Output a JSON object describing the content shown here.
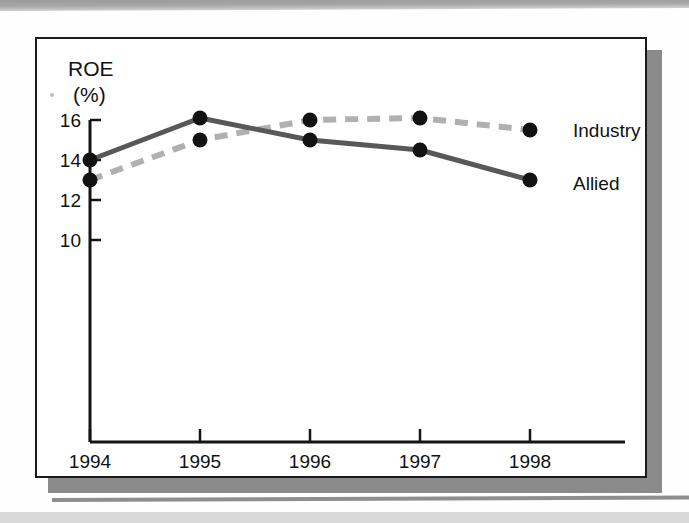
{
  "chart_data": {
    "type": "line",
    "title": "",
    "subtitle": "",
    "xlabel": "",
    "ylabel": "ROE",
    "ylabel_unit": "(%)",
    "categories": [
      "1994",
      "1995",
      "1996",
      "1997",
      "1998"
    ],
    "x": [
      1994,
      1995,
      1996,
      1997,
      1998
    ],
    "series": [
      {
        "name": "Industry",
        "values": [
          13,
          15,
          16,
          16.1,
          15.5
        ],
        "style": "dashed",
        "color": "#b0b0b0",
        "marker": "circle"
      },
      {
        "name": "Allied",
        "values": [
          14,
          16.1,
          15,
          14.5,
          13
        ],
        "style": "solid",
        "color": "#585858",
        "marker": "circle"
      }
    ],
    "yticks": [
      16,
      14,
      12,
      10
    ],
    "ytick_labels": [
      "16",
      "14",
      "12",
      "10"
    ],
    "ylim": [
      8.4,
      16.6
    ],
    "xtick_labels": [
      "1994",
      "1995",
      "1996",
      "1997",
      "1998"
    ],
    "grid": false,
    "legend_position": "right-inline",
    "legend_entries": [
      "Industry",
      "Allied"
    ]
  },
  "axes": {
    "y_axis_title": "ROE",
    "y_axis_unit": "(%)",
    "y_ticks": [
      "16",
      "14",
      "12",
      "10"
    ],
    "x_ticks": [
      "1994",
      "1995",
      "1996",
      "1997",
      "1998"
    ]
  },
  "legend": {
    "industry_label": "Industry",
    "allied_label": "Allied"
  },
  "colors": {
    "allied_line": "#585858",
    "industry_line": "#b0b0b0",
    "marker": "#121212",
    "axis": "#141414",
    "frame_border": "#1a1a1a",
    "frame_shadow": "#8a8a8a",
    "scan_band": "#a6a6a6"
  }
}
